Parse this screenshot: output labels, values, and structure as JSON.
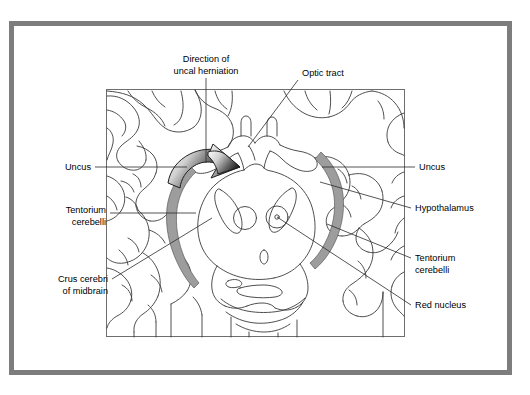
{
  "figure": {
    "type": "medical-illustration",
    "colors": {
      "frame": "#7d7d7d",
      "background": "#ffffff",
      "outline": "#3a3a3a",
      "tentorium_fill": "#9d9d9d",
      "leader": "#2a2a2a",
      "text": "#000000",
      "arrow_light": "#f2f2f2",
      "arrow_dark": "#2b2b2b"
    },
    "frame": {
      "x": 9,
      "y": 21,
      "width": 503,
      "height": 354,
      "thickness": 5
    },
    "panel": {
      "x": 106,
      "y": 89,
      "width": 299,
      "height": 248
    }
  },
  "labels": {
    "direction_of_uncal_herniation": {
      "line1": "Direction of",
      "line2": "uncal herniation"
    },
    "optic_tract": {
      "line1": "Optic tract"
    },
    "uncus_left": {
      "line1": "Uncus"
    },
    "uncus_right": {
      "line1": "Uncus"
    },
    "tentorium_cerebelli_left": {
      "line1": "Tentorium",
      "line2": "cerebelli"
    },
    "tentorium_cerebelli_right": {
      "line1": "Tentorium",
      "line2": "cerebelli"
    },
    "crus_cerebri_of_midbrain": {
      "line1": "Crus cerebri",
      "line2": "of midbrain"
    },
    "hypothalamus": {
      "line1": "Hypothalamus"
    },
    "red_nucleus": {
      "line1": "Red nucleus"
    }
  },
  "structures": [
    {
      "name": "tentorium-cerebelli-left-arc",
      "kind": "shaded-arc",
      "side": "left"
    },
    {
      "name": "tentorium-cerebelli-right-arc",
      "kind": "shaded-arc",
      "side": "right"
    },
    {
      "name": "red-nucleus-left",
      "kind": "circle",
      "side": "left"
    },
    {
      "name": "red-nucleus-right",
      "kind": "circle",
      "side": "right"
    },
    {
      "name": "crus-cerebri-left",
      "kind": "elongated-oval",
      "side": "left"
    },
    {
      "name": "crus-cerebri-right",
      "kind": "elongated-oval",
      "side": "right"
    },
    {
      "name": "cerebral-aqueduct",
      "kind": "small-oval",
      "side": "midline"
    },
    {
      "name": "optic-tract-chiasm",
      "kind": "outline",
      "side": "midline"
    },
    {
      "name": "hypothalamus-region",
      "kind": "outline",
      "side": "midline"
    },
    {
      "name": "uncal-herniation-arrow",
      "kind": "gradient-arrow",
      "side": "left"
    }
  ]
}
